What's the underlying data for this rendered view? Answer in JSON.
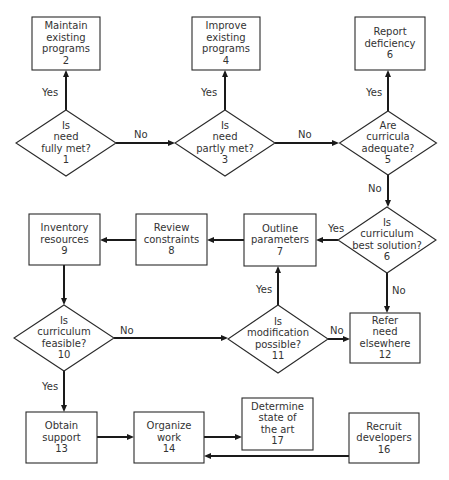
{
  "diagram": {
    "type": "flowchart",
    "nodes": [
      {
        "id": "n1",
        "shape": "diamond",
        "number": "1",
        "lines": [
          "Is",
          "need",
          "fully met?",
          "1"
        ],
        "cx": 66,
        "cy": 143,
        "w": 100,
        "h": 66
      },
      {
        "id": "n2",
        "shape": "box",
        "number": "2",
        "lines": [
          "Maintain",
          "existing",
          "programs",
          "2"
        ],
        "x": 32,
        "y": 17,
        "w": 68,
        "h": 53
      },
      {
        "id": "n3",
        "shape": "diamond",
        "number": "3",
        "lines": [
          "Is",
          "need",
          "partly met?",
          "3"
        ],
        "cx": 225,
        "cy": 143,
        "w": 100,
        "h": 66
      },
      {
        "id": "n4",
        "shape": "box",
        "number": "4",
        "lines": [
          "Improve",
          "existing",
          "programs",
          "4"
        ],
        "x": 192,
        "y": 17,
        "w": 68,
        "h": 53
      },
      {
        "id": "n5",
        "shape": "diamond",
        "number": "5",
        "lines": [
          "Are",
          "curricula",
          "adequate?",
          "5"
        ],
        "cx": 388,
        "cy": 143,
        "w": 97,
        "h": 64
      },
      {
        "id": "n6a",
        "shape": "box",
        "number": "6",
        "lines": [
          "Report",
          "deficiency",
          "6"
        ],
        "x": 355,
        "y": 17,
        "w": 70,
        "h": 53
      },
      {
        "id": "n6b",
        "shape": "diamond",
        "number": "6",
        "lines": [
          "Is",
          "curriculum",
          "best solution?",
          "6"
        ],
        "cx": 387,
        "cy": 240,
        "w": 98,
        "h": 66
      },
      {
        "id": "n7",
        "shape": "box",
        "number": "7",
        "lines": [
          "Outline",
          "parameters",
          "7"
        ],
        "x": 244,
        "y": 214,
        "w": 72,
        "h": 52
      },
      {
        "id": "n8",
        "shape": "box",
        "number": "8",
        "lines": [
          "Review",
          "constraints",
          "8"
        ],
        "x": 136,
        "y": 214,
        "w": 71,
        "h": 51
      },
      {
        "id": "n9",
        "shape": "box",
        "number": "9",
        "lines": [
          "Inventory",
          "resources",
          "9"
        ],
        "x": 29,
        "y": 214,
        "w": 71,
        "h": 51
      },
      {
        "id": "n10",
        "shape": "diamond",
        "number": "10",
        "lines": [
          "Is",
          "curriculum",
          "feasible?",
          "10"
        ],
        "cx": 64,
        "cy": 338,
        "w": 100,
        "h": 66
      },
      {
        "id": "n11",
        "shape": "diamond",
        "number": "11",
        "lines": [
          "Is",
          "modification",
          "possible?",
          "11"
        ],
        "cx": 278,
        "cy": 339,
        "w": 100,
        "h": 68
      },
      {
        "id": "n12",
        "shape": "box",
        "number": "12",
        "lines": [
          "Refer",
          "need",
          "elsewhere",
          "12"
        ],
        "x": 350,
        "y": 313,
        "w": 70,
        "h": 50
      },
      {
        "id": "n13",
        "shape": "box",
        "number": "13",
        "lines": [
          "Obtain",
          "support",
          "13"
        ],
        "x": 26,
        "y": 412,
        "w": 71,
        "h": 51
      },
      {
        "id": "n14",
        "shape": "box",
        "number": "14",
        "lines": [
          "Organize",
          "work",
          "14"
        ],
        "x": 134,
        "y": 412,
        "w": 70,
        "h": 51
      },
      {
        "id": "n17",
        "shape": "box",
        "number": "17",
        "lines": [
          "Determine",
          "state of",
          "the art",
          "17"
        ],
        "x": 242,
        "y": 398,
        "w": 71,
        "h": 52
      },
      {
        "id": "n16",
        "shape": "box",
        "number": "16",
        "lines": [
          "Recruit",
          "developers",
          "16"
        ],
        "x": 349,
        "y": 413,
        "w": 70,
        "h": 50
      }
    ],
    "edges": [
      {
        "from": "n1",
        "to": "n2",
        "label": "Yes",
        "points": [
          [
            66,
            110
          ],
          [
            66,
            70
          ]
        ],
        "label_pos": [
          42,
          96
        ]
      },
      {
        "from": "n1",
        "to": "n3",
        "label": "No",
        "points": [
          [
            116,
            143
          ],
          [
            175,
            143
          ]
        ],
        "label_pos": [
          134,
          138
        ]
      },
      {
        "from": "n3",
        "to": "n4",
        "label": "Yes",
        "points": [
          [
            225,
            110
          ],
          [
            225,
            70
          ]
        ],
        "label_pos": [
          201,
          96
        ]
      },
      {
        "from": "n3",
        "to": "n5",
        "label": "No",
        "points": [
          [
            275,
            143
          ],
          [
            339,
            143
          ]
        ],
        "label_pos": [
          298,
          138
        ]
      },
      {
        "from": "n5",
        "to": "n6a",
        "label": "Yes",
        "points": [
          [
            388,
            111
          ],
          [
            388,
            70
          ]
        ],
        "label_pos": [
          366,
          96
        ]
      },
      {
        "from": "n5",
        "to": "n6b",
        "label": "No",
        "points": [
          [
            388,
            175
          ],
          [
            388,
            207
          ]
        ],
        "label_pos": [
          368,
          192
        ]
      },
      {
        "from": "n6b",
        "to": "n7",
        "label": "Yes",
        "points": [
          [
            338,
            240
          ],
          [
            316,
            240
          ]
        ],
        "label_pos": [
          328,
          232
        ]
      },
      {
        "from": "n6b",
        "to": "n12",
        "label": "No",
        "points": [
          [
            387,
            273
          ],
          [
            387,
            313
          ]
        ],
        "label_pos": [
          392,
          294
        ]
      },
      {
        "from": "n7",
        "to": "n8",
        "label": "",
        "points": [
          [
            244,
            240
          ],
          [
            207,
            240
          ]
        ]
      },
      {
        "from": "n8",
        "to": "n9",
        "label": "",
        "points": [
          [
            136,
            240
          ],
          [
            100,
            240
          ]
        ]
      },
      {
        "from": "n9",
        "to": "n10",
        "label": "",
        "points": [
          [
            64,
            265
          ],
          [
            64,
            305
          ]
        ]
      },
      {
        "from": "n10",
        "to": "n11",
        "label": "No",
        "points": [
          [
            114,
            338
          ],
          [
            228,
            338
          ]
        ],
        "label_pos": [
          120,
          334
        ]
      },
      {
        "from": "n11",
        "to": "n7",
        "label": "Yes",
        "points": [
          [
            278,
            305
          ],
          [
            278,
            266
          ]
        ],
        "label_pos": [
          256,
          293
        ]
      },
      {
        "from": "n11",
        "to": "n12",
        "label": "No",
        "points": [
          [
            328,
            339
          ],
          [
            350,
            339
          ]
        ],
        "label_pos": [
          330,
          334
        ]
      },
      {
        "from": "n10",
        "to": "n13",
        "label": "Yes",
        "points": [
          [
            64,
            371
          ],
          [
            64,
            412
          ]
        ],
        "label_pos": [
          42,
          390
        ]
      },
      {
        "from": "n13",
        "to": "n14",
        "label": "",
        "points": [
          [
            97,
            437
          ],
          [
            134,
            437
          ]
        ]
      },
      {
        "from": "n14",
        "to": "n17",
        "label": "",
        "points": [
          [
            204,
            437
          ],
          [
            242,
            437
          ]
        ]
      },
      {
        "from": "n16",
        "to": "n14",
        "label": "",
        "points": [
          [
            349,
            456
          ],
          [
            204,
            456
          ]
        ]
      }
    ]
  },
  "style": {
    "stroke_color": "#1a1a1a",
    "text_color": "#333333",
    "background": "#ffffff"
  }
}
